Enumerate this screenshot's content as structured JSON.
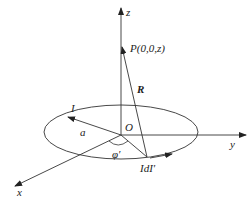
{
  "diagram": {
    "axes": {
      "z": {
        "label": "z"
      },
      "y": {
        "label": "y"
      },
      "x": {
        "label": "x"
      }
    },
    "origin": {
      "label": "O"
    },
    "point_p": {
      "label": "P(0,0,z)"
    },
    "vector_r": {
      "label": "R"
    },
    "current": {
      "label": "I"
    },
    "radius": {
      "label": "a"
    },
    "angle": {
      "label": "φ′"
    },
    "element": {
      "label": "IdI′"
    },
    "colors": {
      "line": "#333333",
      "background": "#ffffff"
    }
  }
}
